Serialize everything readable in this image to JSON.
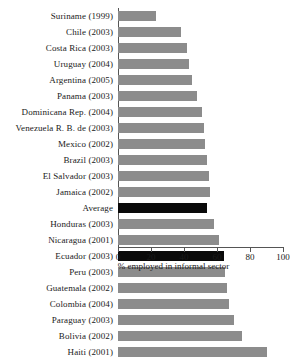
{
  "chart_data": {
    "type": "bar",
    "orientation": "horizontal",
    "title": "",
    "xlabel": "% employed in informal sector",
    "ylabel": "",
    "xlim": [
      0,
      100
    ],
    "xticks": [
      0,
      20,
      40,
      60,
      80,
      100
    ],
    "xticklabels": [
      "0",
      "20",
      "40",
      "60",
      "80",
      "100"
    ],
    "grid": false,
    "legend": false,
    "colors": {
      "bar": "#8c8c8c",
      "highlight": "#0a0a0a",
      "axis": "#555555",
      "text": "#1a1a1a",
      "background": "#ffffff"
    },
    "categories": [
      "Suriname (1999)",
      "Chile (2003)",
      "Costa Rica (2003)",
      "Uruguay (2004)",
      "Argentina (2005)",
      "Panama (2003)",
      "Dominicana Rep. (2004)",
      "Venezuela R. B. de (2003)",
      "Mexico (2002)",
      "Brazil (2003)",
      "El Salvador (2003)",
      "Jamaica (2002)",
      "Average",
      "Honduras (2003)",
      "Nicaragua (2001)",
      "Ecuador (2003)",
      "Peru (2003)",
      "Guatemala (2002)",
      "Colombia (2004)",
      "Paraguay (2003)",
      "Bolivia (2002)",
      "Haiti (2001)"
    ],
    "values": [
      23,
      38,
      42,
      43,
      45,
      48,
      51,
      52,
      53,
      54,
      55,
      56,
      54,
      58,
      61,
      64,
      65,
      66,
      67,
      70,
      75,
      90
    ],
    "highlighted": [
      "Average",
      "Ecuador (2003)"
    ],
    "series": [
      {
        "name": "% employed in informal sector",
        "values": [
          23,
          38,
          42,
          43,
          45,
          48,
          51,
          52,
          53,
          54,
          55,
          56,
          54,
          58,
          61,
          64,
          65,
          66,
          67,
          70,
          75,
          90
        ]
      }
    ]
  }
}
